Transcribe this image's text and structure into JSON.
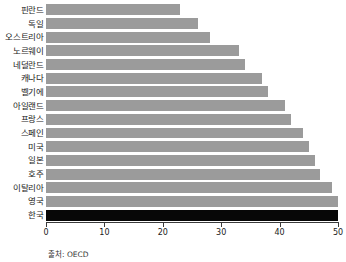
{
  "chart_data": {
    "type": "bar",
    "orientation": "horizontal",
    "title": "",
    "subtitle": "",
    "xlabel": "",
    "ylabel": "",
    "xlim": [
      0,
      50
    ],
    "ylim": null,
    "grid": false,
    "legend": null,
    "source": "출처: OECD",
    "xticks": [
      "0",
      "10",
      "20",
      "30",
      "40",
      "50"
    ],
    "xtick_values": [
      0,
      10,
      20,
      30,
      40,
      50
    ],
    "categories": [
      "핀란드",
      "독일",
      "오스트리아",
      "노르웨이",
      "네덜란드",
      "캐나다",
      "벨기에",
      "아일랜드",
      "프랑스",
      "스페인",
      "미국",
      "일본",
      "호주",
      "이탈리아",
      "영국",
      "한국"
    ],
    "values": [
      23,
      26,
      28,
      33,
      34,
      37,
      38,
      41,
      42,
      44,
      45,
      46,
      47,
      49,
      50,
      50
    ],
    "bar_colors": [
      "#9b9b9b",
      "#9b9b9b",
      "#9b9b9b",
      "#9b9b9b",
      "#9b9b9b",
      "#9b9b9b",
      "#9b9b9b",
      "#9b9b9b",
      "#9b9b9b",
      "#9b9b9b",
      "#9b9b9b",
      "#9b9b9b",
      "#9b9b9b",
      "#9b9b9b",
      "#9b9b9b",
      "#070707"
    ],
    "highlight_category": "한국",
    "colors": {
      "bar": "#9b9b9b",
      "highlight_bar": "#070707",
      "axis": "#3a3a3a",
      "text": "#1a1a1a",
      "background": "#ffffff"
    }
  }
}
